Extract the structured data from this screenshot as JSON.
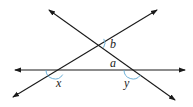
{
  "diagram": {
    "type": "intersecting-lines-angles",
    "line_color": "#1a1a1a",
    "arc_color": "#5fa8d3",
    "lines": [
      {
        "name": "horizontal-line",
        "x1": 15,
        "y1": 70,
        "x2": 185,
        "y2": 70
      },
      {
        "name": "rising-line",
        "x1": 13,
        "y1": 97,
        "x2": 157,
        "y2": 10
      },
      {
        "name": "falling-line",
        "x1": 49,
        "y1": 10,
        "x2": 175,
        "y2": 100
      }
    ],
    "labels": {
      "a": "a",
      "b": "b",
      "x": "x",
      "y": "y"
    }
  }
}
